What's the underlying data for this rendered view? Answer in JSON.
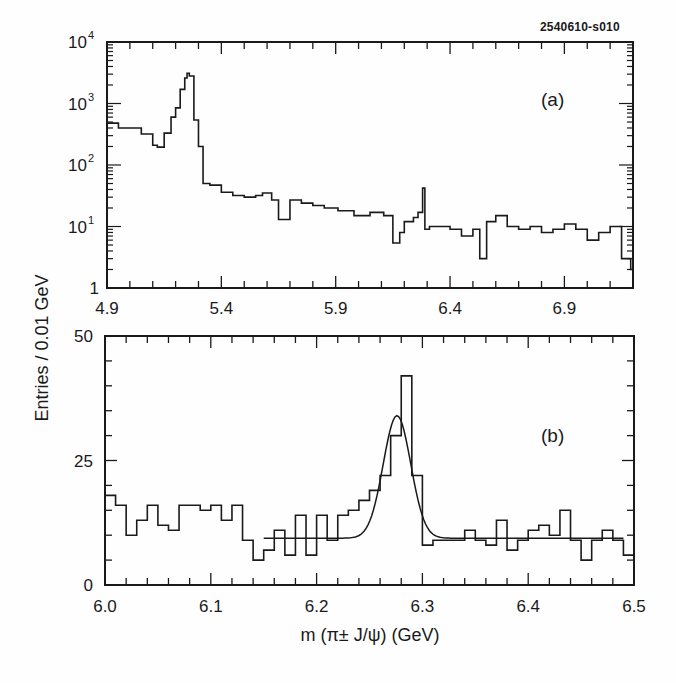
{
  "figure_id": "2540610-s010",
  "ylabel": "Entries / 0.01 GeV",
  "xlabel": "m (π± J/ψ) (GeV)",
  "panels": {
    "a": {
      "tag": "(a)"
    },
    "b": {
      "tag": "(b)"
    }
  },
  "colors": {
    "line": "#1a1a1a",
    "background": "#fefefe"
  },
  "chart_data": [
    {
      "type": "line",
      "subtype": "step-histogram",
      "panel": "(a)",
      "title": "",
      "xlabel": "m (π± J/ψ) (GeV)",
      "ylabel": "Entries / 0.01 GeV",
      "yscale": "log",
      "xlim": [
        4.9,
        7.2
      ],
      "ylim": [
        1,
        10000
      ],
      "xticks": [
        4.9,
        5.4,
        5.9,
        6.4,
        6.9
      ],
      "xtick_labels": [
        "4.9",
        "5.4",
        "5.9",
        "6.4",
        "6.9"
      ],
      "yticks": [
        1,
        10,
        100,
        1000,
        10000
      ],
      "ytick_labels": [
        "1",
        "10¹",
        "10²",
        "10³",
        "10⁴"
      ],
      "grid": false,
      "series": [
        {
          "name": "data",
          "x": [
            4.9,
            4.95,
            5.0,
            5.05,
            5.1,
            5.12,
            5.15,
            5.18,
            5.2,
            5.22,
            5.24,
            5.25,
            5.26,
            5.28,
            5.3,
            5.32,
            5.35,
            5.4,
            5.45,
            5.5,
            5.55,
            5.58,
            5.62,
            5.65,
            5.7,
            5.75,
            5.8,
            5.85,
            5.91,
            5.98,
            6.05,
            6.11,
            6.15,
            6.18,
            6.2,
            6.24,
            6.26,
            6.28,
            6.29,
            6.31,
            6.35,
            6.4,
            6.45,
            6.5,
            6.53,
            6.56,
            6.6,
            6.65,
            6.7,
            6.75,
            6.8,
            6.85,
            6.9,
            6.95,
            7.0,
            7.05,
            7.1,
            7.15,
            7.19
          ],
          "values": [
            480,
            400,
            400,
            320,
            210,
            195,
            330,
            600,
            850,
            1700,
            2600,
            3100,
            2800,
            540,
            200,
            50,
            47,
            36,
            32,
            30,
            32,
            35,
            27,
            13,
            27,
            24,
            22,
            20,
            18,
            15,
            17,
            15,
            5.4,
            8,
            12,
            14,
            17,
            42,
            9,
            10,
            10,
            9,
            7,
            9,
            3,
            12,
            15,
            10,
            9,
            10,
            8,
            9,
            11,
            9,
            6,
            8,
            10,
            3,
            2
          ]
        }
      ]
    },
    {
      "type": "bar",
      "subtype": "step-histogram-with-fit",
      "panel": "(b)",
      "title": "",
      "xlabel": "m (π± J/ψ) (GeV)",
      "ylabel": "Entries / 0.01 GeV",
      "xlim": [
        6.0,
        6.5
      ],
      "ylim": [
        0,
        50
      ],
      "xticks": [
        6.0,
        6.1,
        6.2,
        6.3,
        6.4,
        6.5
      ],
      "xtick_labels": [
        "6.0",
        "6.1",
        "6.2",
        "6.3",
        "6.4",
        "6.5"
      ],
      "yticks": [
        0,
        25,
        50
      ],
      "ytick_labels": [
        "0",
        "25",
        "50"
      ],
      "grid": false,
      "bin_width": 0.01,
      "categories": [
        6.0,
        6.01,
        6.02,
        6.03,
        6.04,
        6.05,
        6.06,
        6.07,
        6.08,
        6.09,
        6.1,
        6.11,
        6.12,
        6.13,
        6.14,
        6.15,
        6.16,
        6.17,
        6.18,
        6.19,
        6.2,
        6.21,
        6.22,
        6.23,
        6.24,
        6.25,
        6.26,
        6.27,
        6.28,
        6.29,
        6.3,
        6.31,
        6.32,
        6.33,
        6.34,
        6.35,
        6.36,
        6.37,
        6.38,
        6.39,
        6.4,
        6.41,
        6.42,
        6.43,
        6.44,
        6.45,
        6.46,
        6.47,
        6.48,
        6.49
      ],
      "series": [
        {
          "name": "data",
          "values": [
            18,
            16,
            10,
            13,
            16,
            12,
            11,
            16,
            16,
            15,
            16,
            13,
            16,
            9,
            5,
            7,
            11,
            6,
            14,
            6,
            14,
            9,
            14,
            15,
            17,
            19,
            22,
            30,
            42,
            22,
            8,
            9,
            9,
            9,
            11,
            9,
            8,
            13,
            7,
            9,
            11,
            12,
            10,
            15,
            9,
            5,
            9,
            11,
            9,
            6
          ]
        },
        {
          "name": "fit",
          "kind": "gaussian-plus-flat",
          "x_range": [
            6.15,
            6.49
          ],
          "peak_x": 6.276,
          "peak_y": 34,
          "sigma": 0.013,
          "baseline": 9.4
        }
      ]
    }
  ]
}
